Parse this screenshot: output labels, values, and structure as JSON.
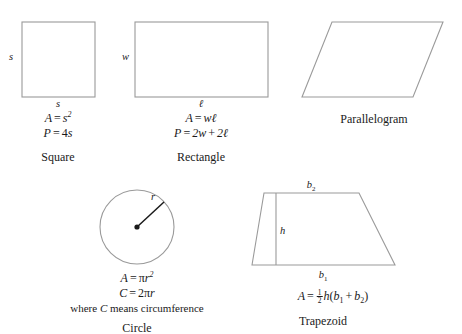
{
  "figure": {
    "background_color": "#ffffff",
    "outline_color": "#9a9a9a",
    "accent_color": "#1a1a1a",
    "text_color": "#1a1a1a"
  },
  "shapes": {
    "square": {
      "name": "Square",
      "side_label": "s",
      "bottom_label": "s",
      "area_lhs": "A",
      "area_var": "s",
      "area_exp": "2",
      "perimeter_lhs": "P",
      "perimeter_coef": "4",
      "perimeter_var": "s",
      "equals": "=",
      "geometry": {
        "x": 22,
        "y": 22,
        "width": 73,
        "height": 75
      }
    },
    "rectangle": {
      "name": "Rectangle",
      "width_label": "w",
      "length_label": "ℓ",
      "area_lhs": "A",
      "area_rhs": "wℓ",
      "perimeter_lhs": "P",
      "perimeter_term1": "2w",
      "perimeter_plus": "+",
      "perimeter_term2": "2ℓ",
      "equals": "=",
      "geometry": {
        "x": 135,
        "y": 22,
        "width": 133,
        "height": 75
      }
    },
    "parallelogram": {
      "name": "Parallelogram",
      "geometry": {
        "points": "332,22 443,22 413,97 302,97"
      }
    },
    "circle": {
      "name": "Circle",
      "radius_label": "r",
      "area_lhs": "A",
      "area_pi": "π",
      "area_var": "r",
      "area_exp": "2",
      "circumference_lhs": "C",
      "circumference_coef": "2",
      "circumference_pi": "π",
      "circumference_var": "r",
      "equals": "=",
      "note_prefix": "where",
      "note_symbol": "C",
      "note_suffix": "means circumference",
      "geometry": {
        "cx": 137,
        "cy": 227,
        "r": 37,
        "radius_end_x": 164,
        "radius_end_y": 202,
        "dot_r": 2.6
      }
    },
    "trapezoid": {
      "name": "Trapezoid",
      "top_base_label": "b",
      "top_base_index": "2",
      "bottom_base_label": "b",
      "bottom_base_index": "1",
      "height_label": "h",
      "area_lhs": "A",
      "equals": "=",
      "frac_top": "1",
      "frac_bot": "2",
      "area_h": "h",
      "area_open": "(",
      "area_b1": "b",
      "area_b1_index": "1",
      "area_plus": "+",
      "area_b2": "b",
      "area_b2_index": "2",
      "area_close": ")",
      "geometry": {
        "points": "252,265 264,193 359,193 395,265",
        "height_line": {
          "x": 276,
          "y1": 193,
          "y2": 265
        }
      }
    }
  }
}
